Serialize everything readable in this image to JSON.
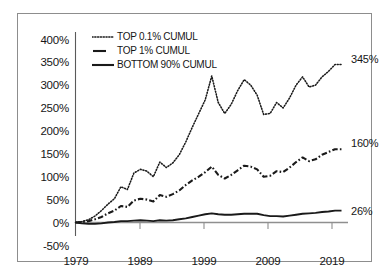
{
  "chart_data": {
    "type": "line",
    "title": "",
    "subtitle": "",
    "xlabel": "",
    "ylabel": "",
    "xlim": [
      1979,
      2021
    ],
    "ylim": [
      -50,
      400
    ],
    "ytick_labels": [
      "400%",
      "350%",
      "300%",
      "250%",
      "200%",
      "150%",
      "100%",
      "50%",
      "0%",
      "-50%"
    ],
    "ytick_values": [
      400,
      350,
      300,
      250,
      200,
      150,
      100,
      50,
      0,
      -50
    ],
    "xtick_labels": [
      "1979",
      "1989",
      "1999",
      "2009",
      "2019"
    ],
    "xtick_values": [
      1979,
      1989,
      1999,
      2009,
      2019
    ],
    "grid": false,
    "legend_position": "top-left-inside",
    "x": [
      1979,
      1980,
      1981,
      1982,
      1983,
      1984,
      1985,
      1986,
      1987,
      1988,
      1989,
      1990,
      1991,
      1992,
      1993,
      1994,
      1995,
      1996,
      1997,
      1998,
      1999,
      2000,
      2001,
      2002,
      2003,
      2004,
      2005,
      2006,
      2007,
      2008,
      2009,
      2010,
      2011,
      2012,
      2013,
      2014,
      2015,
      2016,
      2017,
      2018,
      2019,
      2020
    ],
    "series": [
      {
        "name": "TOP 0.1% CUMUL",
        "style": "dotted",
        "color": "#1a1a1a",
        "end_label": "345%",
        "end_value": 345,
        "values": [
          0,
          2,
          6,
          14,
          26,
          40,
          52,
          78,
          72,
          108,
          116,
          112,
          100,
          132,
          120,
          130,
          148,
          176,
          208,
          238,
          268,
          320,
          262,
          238,
          258,
          288,
          312,
          300,
          278,
          236,
          238,
          262,
          250,
          272,
          300,
          318,
          296,
          300,
          318,
          330,
          345,
          345
        ]
      },
      {
        "name": "TOP 1% CUMUL",
        "style": "dashdot",
        "color": "#1a1a1a",
        "end_label": "160%",
        "end_value": 160,
        "values": [
          0,
          1,
          3,
          7,
          12,
          20,
          26,
          36,
          34,
          48,
          52,
          50,
          46,
          60,
          56,
          62,
          70,
          82,
          92,
          100,
          110,
          122,
          104,
          96,
          104,
          114,
          124,
          122,
          116,
          100,
          102,
          112,
          110,
          120,
          132,
          142,
          134,
          138,
          148,
          154,
          160,
          160
        ]
      },
      {
        "name": "BOTTOM 90% CUMUL",
        "style": "solid",
        "color": "#1a1a1a",
        "end_label": "26%",
        "end_value": 26,
        "values": [
          0,
          -2,
          -3,
          -3,
          -2,
          0,
          1,
          3,
          3,
          4,
          5,
          4,
          3,
          5,
          4,
          5,
          7,
          9,
          12,
          15,
          18,
          20,
          18,
          17,
          17,
          18,
          19,
          19,
          19,
          16,
          14,
          14,
          13,
          15,
          17,
          19,
          20,
          21,
          23,
          24,
          26,
          26
        ]
      }
    ]
  },
  "legend": {
    "items": [
      {
        "label": "TOP 0.1% CUMUL",
        "style": "dotted"
      },
      {
        "label": "TOP 1% CUMUL",
        "style": "dashdot"
      },
      {
        "label": "BOTTOM 90% CUMUL",
        "style": "solid"
      }
    ]
  },
  "axis": {
    "y_labels": [
      "400%",
      "350%",
      "300%",
      "250%",
      "200%",
      "150%",
      "100%",
      "50%",
      "0%",
      "-50%"
    ],
    "x_labels": [
      "1979",
      "1989",
      "1999",
      "2009",
      "2019"
    ]
  },
  "end_labels": {
    "top01": "345%",
    "top1": "160%",
    "bottom90": "26%"
  },
  "colors": {
    "ink": "#1a1a1a",
    "frame": "#8d8d8d",
    "axis": "#4a4a4a",
    "background": "#ffffff"
  }
}
